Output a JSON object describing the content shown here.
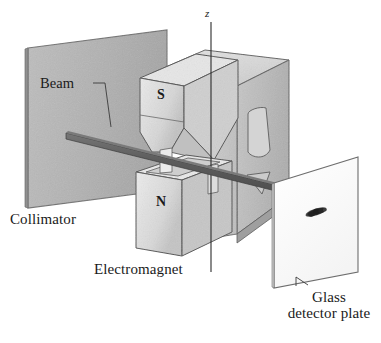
{
  "figure": {
    "background_color": "#ffffff",
    "width": 381,
    "height": 343
  },
  "labels": {
    "beam": "Beam",
    "collimator": "Collimator",
    "electromagnet": "Electromagnet",
    "glass_line1": "Glass",
    "glass_line2": "detector plate",
    "z_axis": "z",
    "pole_south": "S",
    "pole_north": "N"
  },
  "colors": {
    "ink": "#1a1a1a",
    "outline": "#3a3a3a",
    "collimator_face": "#b2b2b2",
    "collimator_edge": "#8d8d8d",
    "magnet_top": "#d8d8d8",
    "magnet_front": "#c9c9c9",
    "magnet_side": "#b8b8b8",
    "magnet_cavity": "#bdbdbd",
    "pole_light": "#e2e2e2",
    "pole_shade": "#c4c4c4",
    "beam_body": "#5a5a5a",
    "beam_top": "#6f6f6f",
    "detector_plate": "#fdfdfd",
    "detector_edge": "#7a7a7a",
    "deposit_spot": "#2b2b2b",
    "axis_line": "#2b2b2b",
    "leader_line": "#3a3a3a"
  },
  "parts": [
    {
      "name": "collimator-plate",
      "description": "Gray rectangular slab at left with a narrow slit that shapes the atomic beam"
    },
    {
      "name": "atomic-beam",
      "description": "Dark narrow strip travelling from the collimator slit, through the magnet gap, to the detector plate"
    },
    {
      "name": "electromagnet-yoke",
      "description": "Large C-shaped magnet body surrounding the beam path"
    },
    {
      "name": "south-pole-piece",
      "description": "Upper wedge-shaped pole tapering to a knife edge, marked S"
    },
    {
      "name": "north-pole-piece",
      "description": "Lower grooved pole piece, marked N"
    },
    {
      "name": "z-axis",
      "description": "Vertical axis line through the magnet gap labelled z"
    },
    {
      "name": "glass-detector-plate",
      "description": "White plate at right where deposited atoms form a mark"
    },
    {
      "name": "deposit-spot",
      "description": "Dark elongated deposit on the glass detector plate"
    }
  ]
}
